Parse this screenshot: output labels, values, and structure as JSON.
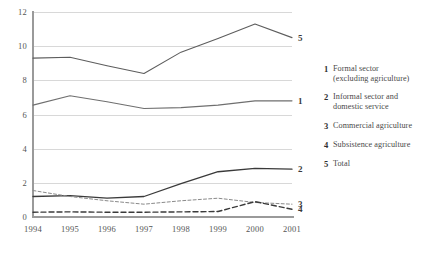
{
  "chart_data": {
    "type": "line",
    "title": "",
    "xlabel": "",
    "ylabel": "",
    "x": [
      1994,
      1995,
      1996,
      1997,
      1998,
      1999,
      2000,
      2001
    ],
    "categories": [
      "1994",
      "1995",
      "1996",
      "1997",
      "1998",
      "1999",
      "2000",
      "2001"
    ],
    "ylim": [
      0,
      12
    ],
    "yticks": [
      0,
      2,
      4,
      6,
      8,
      10,
      12
    ],
    "grid": true,
    "legend_position": "right",
    "series": [
      {
        "key": "1",
        "name": "Formal sector (excluding agriculture)",
        "values": [
          6.55,
          7.1,
          6.75,
          6.35,
          6.4,
          6.55,
          6.8,
          6.8
        ],
        "style": "solid",
        "color": "#6f6f6f",
        "width": 1.1,
        "end_label": "1"
      },
      {
        "key": "2",
        "name": "Informal sector and domestic service",
        "values": [
          1.2,
          1.25,
          1.1,
          1.2,
          1.95,
          2.65,
          2.85,
          2.8
        ],
        "style": "solid",
        "color": "#3a3a3a",
        "width": 1.3,
        "end_label": "2"
      },
      {
        "key": "3",
        "name": "Commercial agriculture",
        "values": [
          1.55,
          1.2,
          0.95,
          0.75,
          0.95,
          1.1,
          0.85,
          0.75
        ],
        "style": "fine-dashed",
        "color": "#8a8a8a",
        "width": 1.0,
        "end_label": "3"
      },
      {
        "key": "4",
        "name": "Subsistence agriculture",
        "values": [
          0.28,
          0.3,
          0.28,
          0.28,
          0.3,
          0.32,
          0.9,
          0.45
        ],
        "style": "bold-dashed",
        "color": "#3a3a3a",
        "width": 1.4,
        "end_label": "4"
      },
      {
        "key": "5",
        "name": "Total",
        "values": [
          9.3,
          9.35,
          8.85,
          8.4,
          9.65,
          10.45,
          11.3,
          10.5
        ],
        "style": "solid",
        "color": "#5d5d5d",
        "width": 1.1,
        "end_label": "5"
      }
    ]
  },
  "legend": {
    "items": [
      {
        "num": "1",
        "label": "Formal sector (excluding agriculture)"
      },
      {
        "num": "2",
        "label": "Informal sector and domestic service"
      },
      {
        "num": "3",
        "label": "Commercial agriculture"
      },
      {
        "num": "4",
        "label": "Subsistence agriculture"
      },
      {
        "num": "5",
        "label": "Total"
      }
    ]
  },
  "colors": {
    "background": "#ffffff",
    "axis": "#9a9a9a",
    "grid": "#d8d8d8",
    "text": "#4a4a4a"
  }
}
